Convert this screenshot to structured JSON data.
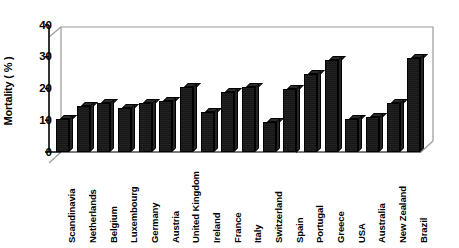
{
  "chart_data": {
    "type": "bar",
    "title": "",
    "subtitle": "",
    "xlabel": "",
    "ylabel": "Mortality ( % )",
    "ylim": [
      0,
      40
    ],
    "yticks": [
      0,
      10,
      20,
      30,
      40
    ],
    "grid": false,
    "legend": null,
    "legend_position": "none",
    "style": "3d-bar",
    "bar_color": "#1a1a1a",
    "categories": [
      "Scandinavia",
      "Netherlands",
      "Belgium",
      "Luxembourg",
      "Germany",
      "Austria",
      "United Kingdom",
      "Ireland",
      "France",
      "Italy",
      "Switzerland",
      "Spain",
      "Portugal",
      "Greece",
      "USA",
      "Australia",
      "New Zealand",
      "Brazil"
    ],
    "values": [
      10.5,
      14.5,
      15.5,
      14.0,
      15.5,
      16.0,
      20.5,
      12.5,
      19.0,
      20.5,
      9.5,
      20.0,
      24.5,
      29.0,
      10.5,
      11.0,
      15.5,
      29.5
    ]
  },
  "axis": {
    "y_tick_labels": [
      "0",
      "10",
      "20",
      "30",
      "40"
    ],
    "y_title": "Mortality ( % )"
  },
  "colors": {
    "bar_front": "#161616",
    "bar_top": "#2a2a2a",
    "bar_side": "#242424",
    "frame": "#8a8a8a",
    "axis": "#000000",
    "background": "#ffffff"
  }
}
